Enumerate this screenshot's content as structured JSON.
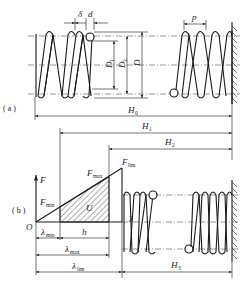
{
  "figure": {
    "part_a": {
      "tag": "( a )",
      "labels": {
        "delta": "δ",
        "d": "d",
        "p": "p",
        "D1": "D",
        "D1_sub": "1",
        "D2": "D",
        "D2_sub": "2",
        "D": "D",
        "H0": "H",
        "H0_sub": "0"
      }
    },
    "part_b": {
      "tag": "( b )",
      "labels": {
        "H1": "H",
        "H1_sub": "1",
        "H2": "H",
        "H2_sub": "2",
        "H3": "H",
        "H3_sub": "3",
        "F": "F",
        "O": "O",
        "Fmin": "F",
        "Fmin_sub": "min",
        "Fmax": "F",
        "Fmax_sub": "max",
        "Flim": "F",
        "Flim_sub": "lim",
        "U": "U",
        "lambda": "λ",
        "lambda_min": "λ",
        "lambda_min_sub": "min",
        "h": "h",
        "lambda_max": "λ",
        "lambda_max_sub": "max",
        "lambda_lim": "λ",
        "lambda_lim_sub": "lim"
      }
    },
    "colors": {
      "line": "#1a1a1a",
      "background": "#ffffff"
    }
  }
}
